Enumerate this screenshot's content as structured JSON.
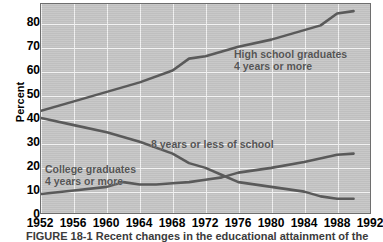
{
  "chart_data": {
    "type": "line",
    "title": "",
    "xlabel": "",
    "ylabel": "Percent",
    "xlim": [
      1952,
      1992
    ],
    "ylim": [
      0,
      88
    ],
    "ytick_values": [
      0,
      10,
      20,
      30,
      40,
      50,
      60,
      70,
      80
    ],
    "ytick_labels": [
      "0",
      "10",
      "20",
      "30",
      "40",
      "50",
      "60",
      "70",
      "80"
    ],
    "xtick_values": [
      1952,
      1956,
      1960,
      1964,
      1968,
      1972,
      1976,
      1980,
      1984,
      1988,
      1992
    ],
    "xtick_labels": [
      "1952",
      "1956",
      "1960",
      "1964",
      "1968",
      "1972",
      "1976",
      "1980",
      "1984",
      "1988",
      "1992"
    ],
    "grid": true,
    "legend_position": "inline-annotations",
    "plot_background_color": "#c6c6c6",
    "gridline_color": "#f2f2f2",
    "series_color": "#5a5a5a",
    "series": [
      {
        "name": "High school graduates 4 years or more",
        "label_line1": "High school graduates",
        "label_line2": "4 years or more",
        "x": [
          1952,
          1956,
          1960,
          1964,
          1968,
          1970,
          1972,
          1974,
          1976,
          1980,
          1982,
          1984,
          1986,
          1988,
          1990
        ],
        "values": [
          43,
          47,
          51,
          55,
          60,
          65,
          66,
          68,
          70,
          73,
          75,
          77,
          79,
          84,
          85
        ]
      },
      {
        "name": "8 years or less of school",
        "label_line1": "8 years or less of school",
        "label_line2": "",
        "x": [
          1952,
          1956,
          1960,
          1964,
          1968,
          1970,
          1972,
          1974,
          1976,
          1980,
          1984,
          1986,
          1988,
          1990
        ],
        "values": [
          40,
          37,
          34,
          30,
          25,
          21,
          19,
          16,
          13,
          11,
          9,
          7,
          6,
          6
        ]
      },
      {
        "name": "College graduates 4 years or more",
        "label_line1": "College graduates",
        "label_line2": "4 years or more",
        "x": [
          1952,
          1956,
          1960,
          1962,
          1964,
          1966,
          1968,
          1970,
          1972,
          1974,
          1976,
          1980,
          1984,
          1988,
          1990
        ],
        "values": [
          8,
          9.5,
          11,
          13,
          12,
          12,
          12.5,
          13,
          14,
          15,
          17,
          19,
          21.5,
          24.5,
          25
        ]
      }
    ],
    "caption": "FIGURE 18-1  Recent changes in the educational attainment of the"
  }
}
